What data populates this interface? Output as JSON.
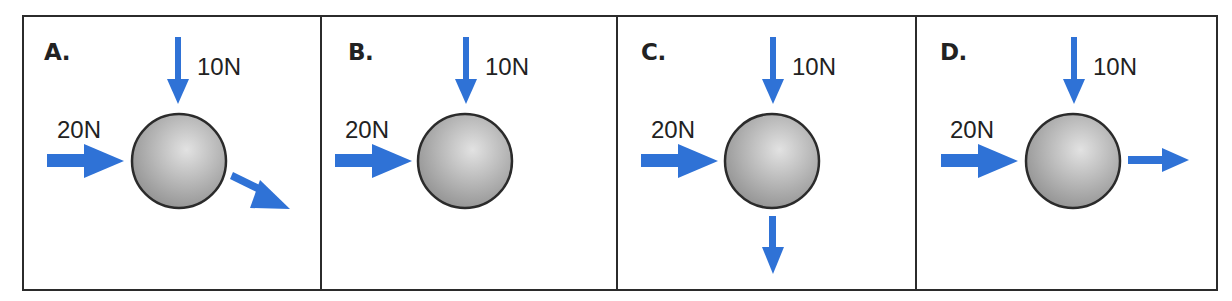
{
  "figure": {
    "colors": {
      "arrow": "#2f72d6",
      "ball_light": "#e2e2e2",
      "ball_dark": "#8e8e8e",
      "border": "#2b2b2b",
      "text": "#222222"
    },
    "panels": [
      {
        "letter": "A.",
        "top_force": "10N",
        "left_force": "20N",
        "resultant_direction": "down-right"
      },
      {
        "letter": "B.",
        "top_force": "10N",
        "left_force": "20N",
        "resultant_direction": "none"
      },
      {
        "letter": "C.",
        "top_force": "10N",
        "left_force": "20N",
        "resultant_direction": "down"
      },
      {
        "letter": "D.",
        "top_force": "10N",
        "left_force": "20N",
        "resultant_direction": "right"
      }
    ]
  }
}
